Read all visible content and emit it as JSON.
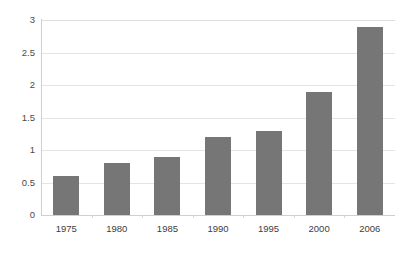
{
  "chart_data": {
    "type": "bar",
    "title": "",
    "subtitle": "",
    "xlabel": "",
    "ylabel": "",
    "categories": [
      "1975",
      "1980",
      "1985",
      "1990",
      "1995",
      "2000",
      "2006"
    ],
    "values": [
      0.6,
      0.8,
      0.9,
      1.2,
      1.3,
      1.9,
      2.9
    ],
    "series": [
      {
        "name": "",
        "values": [
          0.6,
          0.8,
          0.9,
          1.2,
          1.3,
          1.9,
          2.9
        ]
      }
    ],
    "ylim": [
      0,
      3
    ],
    "ytick_labels": [
      "0",
      "0.5",
      "1",
      "1.5",
      "2",
      "2.5",
      "3"
    ],
    "ytick_values": [
      0,
      0.5,
      1,
      1.5,
      2,
      2.5,
      3
    ],
    "grid": {
      "horizontal": true,
      "vertical": false
    },
    "legend": {
      "visible": false,
      "position": "none",
      "entries": []
    },
    "annotations": [],
    "data_labels": false,
    "colors": {
      "bar": "#767676",
      "gridline": "#e4e4e4",
      "axis_line": "#cfcfcf",
      "background": "#ffffff",
      "tick_text": "#3d3d3d"
    }
  },
  "axes": {
    "y": {
      "ticks": [
        {
          "label": "3",
          "value": 3
        },
        {
          "label": "2.5",
          "value": 2.5
        },
        {
          "label": "2",
          "value": 2
        },
        {
          "label": "1.5",
          "value": 1.5
        },
        {
          "label": "1",
          "value": 1
        },
        {
          "label": "0.5",
          "value": 0.5
        },
        {
          "label": "0",
          "value": 0
        }
      ]
    },
    "x": {
      "ticks": [
        {
          "label": "1975"
        },
        {
          "label": "1980"
        },
        {
          "label": "1985"
        },
        {
          "label": "1990"
        },
        {
          "label": "1995"
        },
        {
          "label": "2000"
        },
        {
          "label": "2006"
        }
      ]
    }
  }
}
